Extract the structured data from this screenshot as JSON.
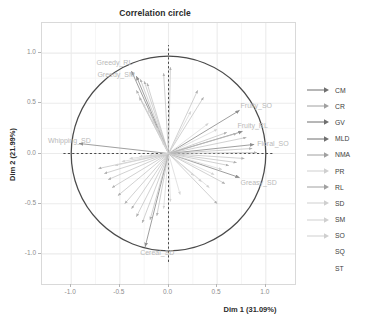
{
  "chart_data": {
    "type": "scatter",
    "title": "Correlation circle",
    "xlabel": "Dim 1 (31.09%)",
    "ylabel": "Dim 2 (21.99%)",
    "xlim": [
      -1.3,
      1.3
    ],
    "ylim": [
      -1.3,
      1.3
    ],
    "xticks": [
      "-1.0",
      "-0.5",
      "0.0",
      "0.5",
      "1.0"
    ],
    "xtick_values": [
      -1.0,
      -0.5,
      0.0,
      0.5,
      1.0
    ],
    "yticks": [
      "1.0",
      "0.5",
      "0.0",
      "-0.5",
      "-1.0"
    ],
    "ytick_values": [
      1.0,
      0.5,
      0.0,
      -0.5,
      -1.0
    ],
    "grid": true,
    "unit_circle": true,
    "reference_lines": [
      "x=0 dashed",
      "y=0 dashed"
    ],
    "legend_position": "right",
    "legend_title": "",
    "arrow_color": "#9e9e9e",
    "label_color": "#b9b9b9",
    "circle_color": "#4a4a4a",
    "series": [
      {
        "name": "Greedy_RL",
        "x": -0.38,
        "y": 0.82,
        "label_shown": true
      },
      {
        "name": "Greedy_SM",
        "x": -0.33,
        "y": 0.77,
        "label_shown": true
      },
      {
        "name": "Whipping_SD",
        "x": -0.92,
        "y": 0.1,
        "label_shown": true
      },
      {
        "name": "Fruity_SO",
        "x": 0.73,
        "y": 0.43,
        "label_shown": true
      },
      {
        "name": "Fruity_RL",
        "x": 0.76,
        "y": 0.22,
        "label_shown": true
      },
      {
        "name": "Floral_SO",
        "x": 0.88,
        "y": 0.09,
        "label_shown": true
      },
      {
        "name": "Greasy_SD",
        "x": 0.73,
        "y": -0.24,
        "label_shown": true
      },
      {
        "name": "Cereal_SD",
        "x": -0.24,
        "y": -0.93,
        "label_shown": true
      },
      {
        "name": "v09",
        "x": -0.29,
        "y": 0.74,
        "label_shown": false
      },
      {
        "name": "v10",
        "x": -0.25,
        "y": 0.72,
        "label_shown": false
      },
      {
        "name": "v11",
        "x": -0.22,
        "y": 0.7,
        "label_shown": false
      },
      {
        "name": "v12",
        "x": -0.33,
        "y": 0.63,
        "label_shown": false
      },
      {
        "name": "v13",
        "x": -0.3,
        "y": 0.56,
        "label_shown": false
      },
      {
        "name": "v14",
        "x": -0.26,
        "y": 0.5,
        "label_shown": false
      },
      {
        "name": "v15",
        "x": -0.21,
        "y": 0.44,
        "label_shown": false
      },
      {
        "name": "v16",
        "x": -0.17,
        "y": 0.33,
        "label_shown": false
      },
      {
        "name": "v17",
        "x": -0.12,
        "y": 0.26,
        "label_shown": false
      },
      {
        "name": "v18",
        "x": -0.09,
        "y": 0.18,
        "label_shown": false
      },
      {
        "name": "v19",
        "x": -0.06,
        "y": 0.11,
        "label_shown": false
      },
      {
        "name": "v20",
        "x": -0.05,
        "y": 0.8,
        "label_shown": false
      },
      {
        "name": "v21",
        "x": 0.02,
        "y": 0.86,
        "label_shown": false
      },
      {
        "name": "v22",
        "x": 0.3,
        "y": 0.63,
        "label_shown": false
      },
      {
        "name": "v23",
        "x": 0.36,
        "y": 0.56,
        "label_shown": false
      },
      {
        "name": "v24",
        "x": 0.23,
        "y": 0.42,
        "label_shown": false
      },
      {
        "name": "v25",
        "x": 0.41,
        "y": 0.3,
        "label_shown": false
      },
      {
        "name": "v26",
        "x": 0.5,
        "y": 0.24,
        "label_shown": false
      },
      {
        "name": "v27",
        "x": 0.6,
        "y": 0.21,
        "label_shown": false
      },
      {
        "name": "v28",
        "x": 0.7,
        "y": 0.2,
        "label_shown": false
      },
      {
        "name": "v29",
        "x": 0.8,
        "y": 0.16,
        "label_shown": false
      },
      {
        "name": "v30",
        "x": 0.86,
        "y": 0.05,
        "label_shown": false
      },
      {
        "name": "v31",
        "x": 0.91,
        "y": 0.01,
        "label_shown": false
      },
      {
        "name": "v32",
        "x": 0.78,
        "y": -0.05,
        "label_shown": false
      },
      {
        "name": "v33",
        "x": 0.7,
        "y": -0.09,
        "label_shown": false
      },
      {
        "name": "v34",
        "x": 0.62,
        "y": -0.12,
        "label_shown": false
      },
      {
        "name": "v35",
        "x": 0.55,
        "y": -0.16,
        "label_shown": false
      },
      {
        "name": "v36",
        "x": 0.47,
        "y": -0.21,
        "label_shown": false
      },
      {
        "name": "v37",
        "x": 0.58,
        "y": -0.3,
        "label_shown": false
      },
      {
        "name": "v38",
        "x": 0.42,
        "y": -0.34,
        "label_shown": false
      },
      {
        "name": "v39",
        "x": 0.34,
        "y": -0.28,
        "label_shown": false
      },
      {
        "name": "v40",
        "x": 0.26,
        "y": -0.22,
        "label_shown": false
      },
      {
        "name": "v41",
        "x": 0.5,
        "y": -0.5,
        "label_shown": false
      },
      {
        "name": "v42",
        "x": 0.12,
        "y": -0.41,
        "label_shown": false
      },
      {
        "name": "v43",
        "x": 0.02,
        "y": -0.48,
        "label_shown": false
      },
      {
        "name": "v44",
        "x": -0.05,
        "y": -0.55,
        "label_shown": false
      },
      {
        "name": "v45",
        "x": -0.12,
        "y": -0.62,
        "label_shown": false
      },
      {
        "name": "v46",
        "x": -0.19,
        "y": -0.66,
        "label_shown": false
      },
      {
        "name": "v47",
        "x": -0.27,
        "y": -0.69,
        "label_shown": false
      },
      {
        "name": "v48",
        "x": -0.33,
        "y": -0.63,
        "label_shown": false
      },
      {
        "name": "v49",
        "x": -0.38,
        "y": -0.55,
        "label_shown": false
      },
      {
        "name": "v50",
        "x": -0.45,
        "y": -0.5,
        "label_shown": false
      },
      {
        "name": "v51",
        "x": -0.52,
        "y": -0.42,
        "label_shown": false
      },
      {
        "name": "v52",
        "x": -0.58,
        "y": -0.34,
        "label_shown": false
      },
      {
        "name": "v53",
        "x": -0.62,
        "y": -0.26,
        "label_shown": false
      },
      {
        "name": "v54",
        "x": -0.66,
        "y": -0.2,
        "label_shown": false
      },
      {
        "name": "v55",
        "x": -0.72,
        "y": -0.15,
        "label_shown": false
      },
      {
        "name": "v56",
        "x": -0.55,
        "y": -0.12,
        "label_shown": false
      },
      {
        "name": "v57",
        "x": -0.48,
        "y": -0.08,
        "label_shown": false
      },
      {
        "name": "v58",
        "x": -0.4,
        "y": -0.05,
        "label_shown": false
      },
      {
        "name": "v59",
        "x": -0.3,
        "y": -0.03,
        "label_shown": false
      },
      {
        "name": "v60",
        "x": -0.2,
        "y": -0.02,
        "label_shown": false
      }
    ],
    "legend_entries": [
      {
        "label": "CM",
        "arrow": "strong"
      },
      {
        "label": "CR",
        "arrow": "medium"
      },
      {
        "label": "GV",
        "arrow": "strong"
      },
      {
        "label": "MLD",
        "arrow": "strong"
      },
      {
        "label": "NMA",
        "arrow": "medium"
      },
      {
        "label": "PR",
        "arrow": "faint"
      },
      {
        "label": "RL",
        "arrow": "medium"
      },
      {
        "label": "SD",
        "arrow": "faint"
      },
      {
        "label": "SM",
        "arrow": "faint"
      },
      {
        "label": "SO",
        "arrow": "faint"
      },
      {
        "label": "SQ",
        "arrow": "none"
      },
      {
        "label": "ST",
        "arrow": "none"
      }
    ]
  }
}
